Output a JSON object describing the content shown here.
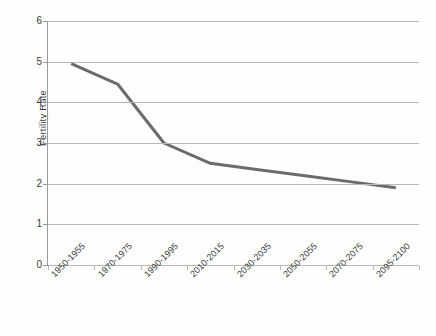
{
  "chart_data": {
    "type": "line",
    "title": "",
    "xlabel": "",
    "ylabel": "Fertility Rate",
    "categories": [
      "1950-1955",
      "1970-1975",
      "1990-1995",
      "2010-2015",
      "2030-2035",
      "2050-2055",
      "2070-2075",
      "2095-2100"
    ],
    "values": [
      4.95,
      4.45,
      3.0,
      2.5,
      2.35,
      2.2,
      2.05,
      1.9
    ],
    "series": [
      {
        "name": "Fertility Rate",
        "values": [
          4.95,
          4.45,
          3.0,
          2.5,
          2.35,
          2.2,
          2.05,
          1.9
        ]
      }
    ],
    "ylim": [
      0,
      6
    ],
    "yticks": [
      0,
      1,
      2,
      3,
      4,
      5,
      6
    ],
    "ytick_labels": [
      "0",
      "1",
      "2",
      "3",
      "4",
      "5",
      "6"
    ],
    "grid": "horizontal",
    "legend": "none",
    "line_color": "#6b6b6b",
    "gridline_color": "#b8b8b8",
    "axis_color": "#9a9a9a",
    "text_color": "#3b3b3b",
    "background_color": "#fefefe"
  }
}
